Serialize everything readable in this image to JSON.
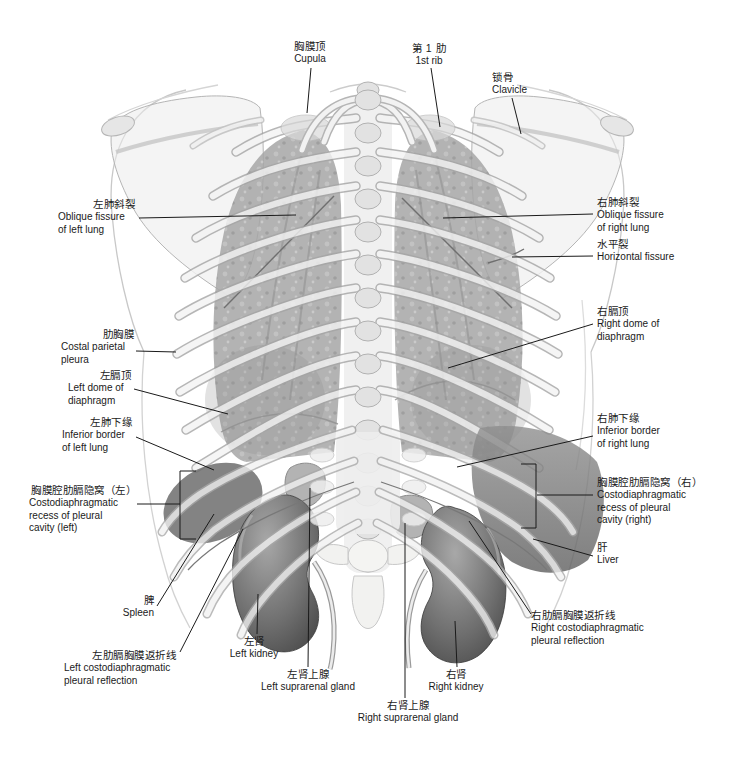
{
  "figure": {
    "type": "anatomical-plate",
    "view": "posterior thorax with pleura, lungs, diaphragm and retroperitoneal organs"
  },
  "colors": {
    "ink": "#1a1a1a",
    "leader_line": "#1a1a1a",
    "background": "#ffffff"
  },
  "labels": [
    {
      "id": "cupula",
      "zh": "胸膜顶",
      "en": "Cupula"
    },
    {
      "id": "first-rib",
      "zh": "第 1 肋",
      "en": "1st rib"
    },
    {
      "id": "clavicle",
      "zh": "锁骨",
      "en": "Clavicle"
    },
    {
      "id": "oblique-fissure-left",
      "zh": "左肺斜裂",
      "en": "Oblique fissure\nof left lung"
    },
    {
      "id": "oblique-fissure-right",
      "zh": "右肺斜裂",
      "en": "Oblique fissure\nof right lung"
    },
    {
      "id": "horizontal-fissure",
      "zh": "水平裂",
      "en": "Horizontal fissure"
    },
    {
      "id": "right-dome-of-diaphragm",
      "zh": "右膈顶",
      "en": "Right dome of\ndiaphragm"
    },
    {
      "id": "costal-parietal-pleura",
      "zh": "肋胸膜",
      "en": "Costal parietal\npleura"
    },
    {
      "id": "left-dome-of-diaphragm",
      "zh": "左膈顶",
      "en": "Left dome of\ndiaphragm"
    },
    {
      "id": "inferior-border-of-left-lung",
      "zh": "左肺下缘",
      "en": "Inferior border\nof left lung"
    },
    {
      "id": "inferior-border-of-right-lung",
      "zh": "右肺下缘",
      "en": "Inferior border\nof right lung"
    },
    {
      "id": "costodiaphragmatic-recess-left",
      "zh": "胸膜腔肋膈隐窝（左）",
      "en": "Costodiaphragmatic\nrecess of pleural\ncavity (left)"
    },
    {
      "id": "costodiaphragmatic-recess-right",
      "zh": "胸膜腔肋膈隐窝（右）",
      "en": "Costodiaphragmatic\nrecess of pleural\ncavity (right)"
    },
    {
      "id": "liver",
      "zh": "肝",
      "en": "Liver"
    },
    {
      "id": "spleen",
      "zh": "脾",
      "en": "Spleen"
    },
    {
      "id": "left-costodiaphragmatic-pleural-reflection",
      "zh": "左肋膈胸膜返折线",
      "en": "Left costodiaphragmatic\npleural reflection"
    },
    {
      "id": "left-kidney",
      "zh": "左肾",
      "en": "Left kidney"
    },
    {
      "id": "left-suprarenal-gland",
      "zh": "左肾上腺",
      "en": "Left suprarenal gland"
    },
    {
      "id": "right-suprarenal-gland",
      "zh": "右肾上腺",
      "en": "Right suprarenal gland"
    },
    {
      "id": "right-kidney",
      "zh": "右肾",
      "en": "Right kidney"
    },
    {
      "id": "right-costodiaphragmatic-pleural-reflection",
      "zh": "右肋膈胸膜返折线",
      "en": "Right costodiaphragmatic\npleural reflection"
    }
  ]
}
